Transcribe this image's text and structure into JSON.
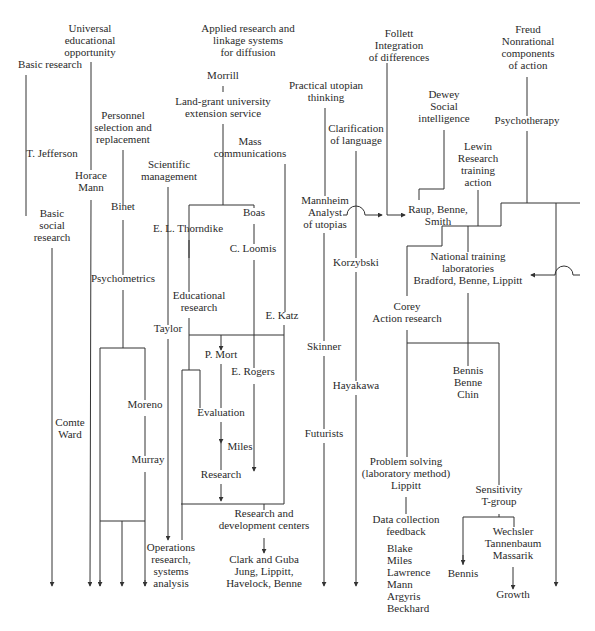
{
  "diagram": {
    "type": "flow-diagram",
    "line_color": "#333333",
    "nodes": [
      {
        "id": "universal-educational-opportunity",
        "text": "Universal\neducational\nopportunity",
        "x": 90,
        "y": 28
      },
      {
        "id": "basic-research",
        "text": "Basic research",
        "x": 50,
        "y": 64
      },
      {
        "id": "applied-research",
        "text": "Applied research and\nlinkage systems\nfor diffusion",
        "x": 248,
        "y": 28
      },
      {
        "id": "follett",
        "text": "Follett\nIntegration\nof differences",
        "x": 399,
        "y": 33
      },
      {
        "id": "freud",
        "text": "Freud\nNonrational\ncomponents\nof action",
        "x": 528,
        "y": 29
      },
      {
        "id": "morrill",
        "text": "Morrill",
        "x": 223,
        "y": 75
      },
      {
        "id": "land-grant",
        "text": "Land-grant university\nextension service",
        "x": 223,
        "y": 101
      },
      {
        "id": "practical-utopian",
        "text": "Practical utopian\nthinking",
        "x": 326,
        "y": 85
      },
      {
        "id": "dewey",
        "text": "Dewey\nSocial\nintelligence",
        "x": 444,
        "y": 94
      },
      {
        "id": "psychotherapy",
        "text": "Psychotherapy",
        "x": 527,
        "y": 120
      },
      {
        "id": "personnel",
        "text": "Personnel\nselection and\nreplacement",
        "x": 123,
        "y": 115
      },
      {
        "id": "clarification",
        "text": "Clarification\nof language",
        "x": 356,
        "y": 128
      },
      {
        "id": "mass-comm",
        "text": "Mass\ncommunications",
        "x": 250,
        "y": 141
      },
      {
        "id": "lewin",
        "text": "Lewin\nResearch\ntraining\naction",
        "x": 478,
        "y": 146
      },
      {
        "id": "t-jefferson",
        "text": "T. Jefferson",
        "x": 52,
        "y": 153
      },
      {
        "id": "scientific-mgmt",
        "text": "Scientific\nmanagement",
        "x": 169,
        "y": 164
      },
      {
        "id": "horace-mann",
        "text": "Horace\nMann",
        "x": 91,
        "y": 175
      },
      {
        "id": "binet",
        "text": "Binet",
        "x": 123,
        "y": 206
      },
      {
        "id": "mannheim",
        "text": "Mannheim\nAnalyst\nof utopias",
        "x": 325,
        "y": 200
      },
      {
        "id": "raup",
        "text": "Raup, Benne,\nSmith",
        "x": 438,
        "y": 209
      },
      {
        "id": "basic-social",
        "text": "Basic\nsocial\nresearch",
        "x": 52,
        "y": 213
      },
      {
        "id": "boas",
        "text": "Boas",
        "x": 254,
        "y": 212
      },
      {
        "id": "thorndike",
        "text": "E. L. Thorndike",
        "x": 188,
        "y": 228
      },
      {
        "id": "national-training",
        "text": "National training\nlaboratories\nBradford, Benne, Lippitt",
        "x": 468,
        "y": 256
      },
      {
        "id": "loomis",
        "text": "C. Loomis",
        "x": 253,
        "y": 248
      },
      {
        "id": "korzybski",
        "text": "Korzybski",
        "x": 356,
        "y": 262
      },
      {
        "id": "psychometrics",
        "text": "Psychometrics",
        "x": 123,
        "y": 278
      },
      {
        "id": "educational-research",
        "text": "Educational\nresearch",
        "x": 199,
        "y": 295
      },
      {
        "id": "e-katz",
        "text": "E. Katz",
        "x": 282,
        "y": 315
      },
      {
        "id": "taylor",
        "text": "Taylor",
        "x": 168,
        "y": 328
      },
      {
        "id": "corey",
        "text": "Corey\nAction research",
        "x": 407,
        "y": 306
      },
      {
        "id": "skinner",
        "text": "Skinner",
        "x": 324,
        "y": 346
      },
      {
        "id": "p-mort",
        "text": "P. Mort",
        "x": 221,
        "y": 354
      },
      {
        "id": "e-rogers",
        "text": "E. Rogers",
        "x": 253,
        "y": 371
      },
      {
        "id": "bennis-benne-chin",
        "text": "Bennis\nBenne\nChin",
        "x": 468,
        "y": 370
      },
      {
        "id": "hayakawa",
        "text": "Hayakawa",
        "x": 356,
        "y": 385
      },
      {
        "id": "moreno",
        "text": "Moreno",
        "x": 145,
        "y": 404
      },
      {
        "id": "evaluation",
        "text": "Evaluation",
        "x": 221,
        "y": 412
      },
      {
        "id": "comte-ward",
        "text": "Comte\nWard",
        "x": 70,
        "y": 422
      },
      {
        "id": "futurists",
        "text": "Futurists",
        "x": 324,
        "y": 433
      },
      {
        "id": "miles-mid",
        "text": "Miles",
        "x": 240,
        "y": 446
      },
      {
        "id": "murray",
        "text": "Murray",
        "x": 148,
        "y": 459
      },
      {
        "id": "problem-solving",
        "text": "Problem solving\n(laboratory method)\nLippitt",
        "x": 406,
        "y": 461
      },
      {
        "id": "research",
        "text": "Research",
        "x": 221,
        "y": 474
      },
      {
        "id": "sensitivity",
        "text": "Sensitivity\nT-group",
        "x": 499,
        "y": 489
      },
      {
        "id": "rd-centers",
        "text": "Research and\ndevelopment centers",
        "x": 264,
        "y": 513
      },
      {
        "id": "data-collection",
        "text": "Data collection\nfeedback",
        "x": 406,
        "y": 519
      },
      {
        "id": "wechsler",
        "text": "Wechsler\nTannenbaum\nMassarik",
        "x": 513,
        "y": 531
      },
      {
        "id": "operations-research",
        "text": "Operations\nresearch,\nsystems\nanalysis",
        "x": 171,
        "y": 547
      },
      {
        "id": "clark-guba",
        "text": "Clark and Guba\nJung, Lippitt,\nHavelock, Benne",
        "x": 264,
        "y": 559
      },
      {
        "id": "blake-list",
        "text": "Blake\nMiles\nLawrence\nMann\nArgyris\nBeckhard",
        "x": 387,
        "y": 548,
        "align": "left"
      },
      {
        "id": "bennis-leaf",
        "text": "Bennis",
        "x": 463,
        "y": 573
      },
      {
        "id": "growth",
        "text": "Growth",
        "x": 513,
        "y": 594
      }
    ]
  }
}
